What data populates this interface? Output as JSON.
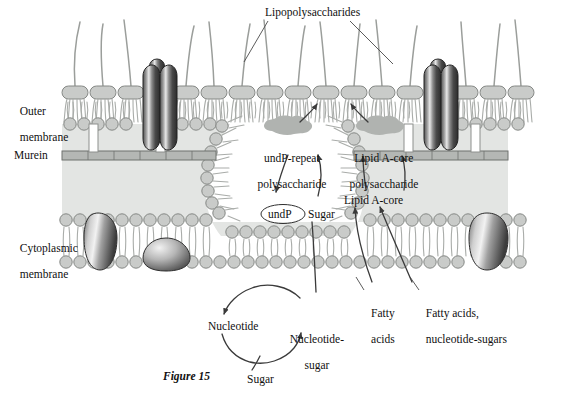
{
  "figure": {
    "caption": "Figure 15",
    "caption_pos": {
      "x": 163,
      "y": 371
    }
  },
  "colors": {
    "periplasm_fill": "#e3e5e3",
    "lipid_head": "#c9cbc9",
    "lipid_stroke": "#8d908d",
    "tail_stroke": "#a9aca9",
    "murein_fill": "#b4b7b4",
    "blob_fill": "#b0b3b0",
    "protein_dark": "#3a3a3a",
    "protein_light": "#efefef",
    "text": "#101010",
    "line": "#4a4a4a",
    "background": "#ffffff"
  },
  "labels": {
    "lipopolysaccharides": {
      "text": "Lipopolysaccharides",
      "x": 265,
      "y": 8
    },
    "outer_membrane": {
      "line1": "Outer",
      "line2": "membrane",
      "x": 14,
      "y": 94
    },
    "murein": {
      "text": "Murein",
      "x": 14,
      "y": 150
    },
    "cytoplasmic_membrane": {
      "line1": "Cytoplasmic",
      "line2": "membrane",
      "x": 14,
      "y": 231
    },
    "undp_repeat_polysaccharide": {
      "line1": "undP-repeat",
      "line2": "polysaccharide",
      "x": 255,
      "y": 141
    },
    "lipid_a_core_polysaccharide": {
      "line1": "Lipid A-core",
      "line2": "polysaccharide",
      "x": 345,
      "y": 141
    },
    "lipid_a_core": {
      "text": "Lipid A-core",
      "x": 346,
      "y": 196
    },
    "undp": {
      "text": "undP",
      "x": 268,
      "y": 210
    },
    "sugar_membrane": {
      "text": "Sugar",
      "x": 304,
      "y": 210
    },
    "nucleotide": {
      "text": "Nucleotide",
      "x": 208,
      "y": 322
    },
    "nucleotide_sugar": {
      "line1": "Nucleotide-",
      "line2": "sugar",
      "x": 286,
      "y": 322
    },
    "sugar_bottom": {
      "text": "Sugar",
      "x": 247,
      "y": 375
    },
    "fatty_acids": {
      "line1": "Fatty",
      "line2": "acids",
      "x": 365,
      "y": 296
    },
    "fatty_acids_nucleotide_sugars": {
      "line1": "Fatty acids,",
      "line2": "nucleotide-sugars",
      "x": 420,
      "y": 296
    }
  },
  "diagram": {
    "layers": [
      {
        "name": "outer-membrane",
        "y_top": 80,
        "y_bottom": 140
      },
      {
        "name": "murein-layer",
        "y": 155
      },
      {
        "name": "periplasm",
        "y_top": 140,
        "y_bottom": 212
      },
      {
        "name": "cytoplasmic-membrane",
        "y_top": 212,
        "y_bottom": 270
      }
    ],
    "proteins": [
      {
        "name": "porin-left",
        "x": 150,
        "y": 70
      },
      {
        "name": "porin-right",
        "x": 432,
        "y": 70
      },
      {
        "name": "inner-membrane-protein-left",
        "x": 98,
        "y": 222
      },
      {
        "name": "inner-membrane-protein-blob",
        "x": 165,
        "y": 252
      },
      {
        "name": "inner-membrane-protein-right",
        "x": 478,
        "y": 222
      }
    ],
    "blobs": [
      {
        "name": "undp-repeat-blob",
        "x": 290,
        "y": 127
      },
      {
        "name": "lipid-a-core-blob",
        "x": 382,
        "y": 127
      }
    ]
  }
}
